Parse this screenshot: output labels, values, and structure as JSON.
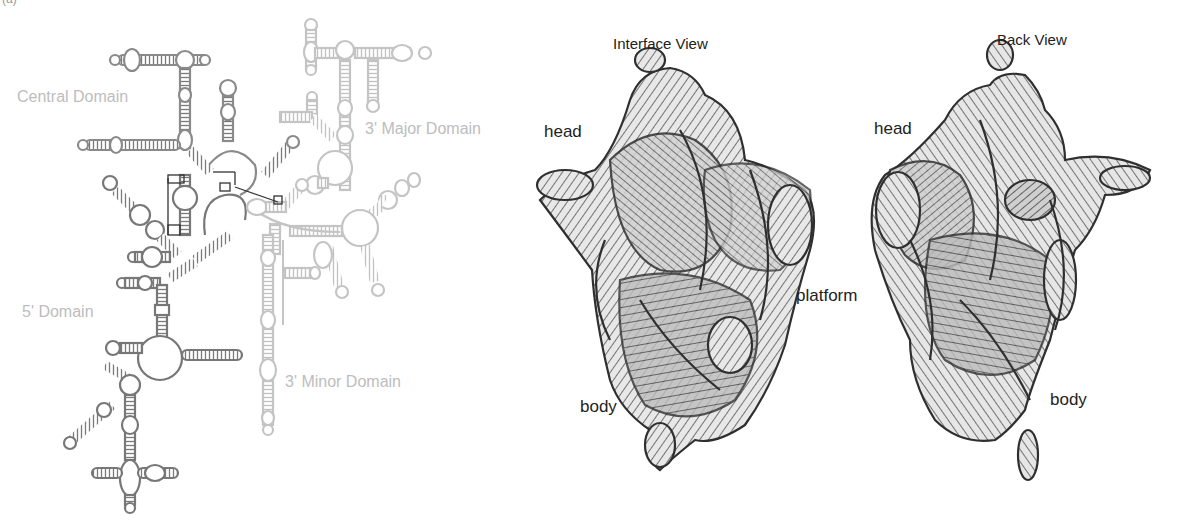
{
  "figure": {
    "panel_letter": "(a)",
    "secondary_structure": {
      "labels": {
        "central": "Central Domain",
        "major3": "3' Major Domain",
        "five": "5' Domain",
        "minor3": "3' Minor Domain"
      },
      "colors": {
        "dark_domain": "#777777",
        "light_domain": "#c4c4c4",
        "label": "#bdbdbd",
        "tertiary_lines": "#333333"
      }
    },
    "interface_view": {
      "title": "Interface View",
      "labels": {
        "head": "head",
        "platform": "platform",
        "body": "body"
      }
    },
    "back_view": {
      "title": "Back View",
      "labels": {
        "head": "head",
        "body": "body"
      }
    }
  }
}
